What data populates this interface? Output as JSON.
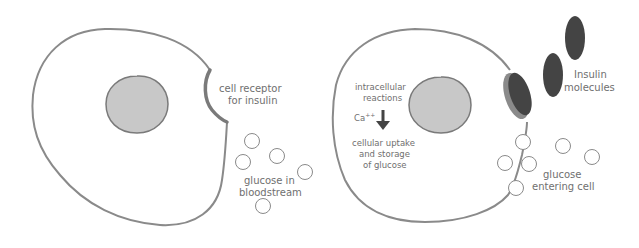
{
  "colors": {
    "background": "#ffffff",
    "membrane": "#8a8a8a",
    "nucleus_fill": "#c8c8c8",
    "nucleus_stroke": "#7a7a7a",
    "receptor": "#7a7a7a",
    "insulin_fill": "#444444",
    "glucose_stroke": "#8a8a8a",
    "label_text": "#6f6f6f"
  },
  "left_panel": {
    "title": "Cell without insulin",
    "labels": {
      "receptor_line1": "cell receptor",
      "receptor_line2": "for insulin",
      "glucose_line1": "glucose in",
      "glucose_line2": "bloodstream"
    },
    "glucose_count": 5
  },
  "right_panel": {
    "title": "Cell with insulin bound",
    "labels": {
      "reactions_line1": "intracellular",
      "reactions_line2": "reactions",
      "ion": "Ca",
      "ion_charge": "++",
      "uptake_line1": "cellular uptake",
      "uptake_line2": "and storage",
      "uptake_line3": "of glucose",
      "insulin_line1": "Insulin",
      "insulin_line2": "molecules",
      "glucose_line1": "glucose",
      "glucose_line2": "entering cell"
    },
    "glucose_count": 6,
    "insulin_molecule_count": 3
  }
}
